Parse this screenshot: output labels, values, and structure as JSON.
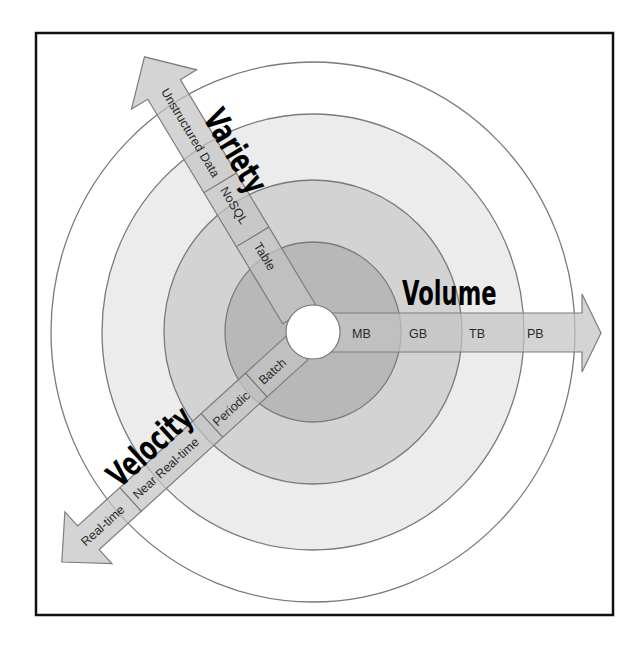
{
  "diagram": {
    "title": "",
    "center": {
      "x": 313,
      "y": 332
    },
    "rings": [
      {
        "name": "outer",
        "rx": 262,
        "ry": 270,
        "fill": "#ffffff"
      },
      {
        "name": "ring-2",
        "rx": 211,
        "ry": 218,
        "fill": "#ececec"
      },
      {
        "name": "ring-3",
        "rx": 149,
        "ry": 152,
        "fill": "#d3d3d3"
      },
      {
        "name": "ring-4",
        "rx": 88,
        "ry": 90,
        "fill": "#b8b8b8"
      },
      {
        "name": "hole",
        "rx": 27,
        "ry": 27,
        "fill": "#ffffff"
      }
    ],
    "axes": {
      "volume": {
        "title": "Volume",
        "levels": [
          "MB",
          "GB",
          "TB",
          "PB"
        ]
      },
      "variety": {
        "title": "Variety",
        "levels": [
          "Table",
          "NoSQL",
          "Unstructured Data"
        ]
      },
      "velocity": {
        "title": "Velocity",
        "levels": [
          "Batch",
          "Periodic",
          "Near Real-time",
          "Real-time"
        ]
      }
    },
    "colors": {
      "frame": "#111111",
      "ring_stroke": "#7a7a7a",
      "arrow_fill": "#c4c4c4",
      "arrow_stroke": "#7d7d7d",
      "title_text": "#000000",
      "label_text": "#2a2a2a"
    }
  }
}
